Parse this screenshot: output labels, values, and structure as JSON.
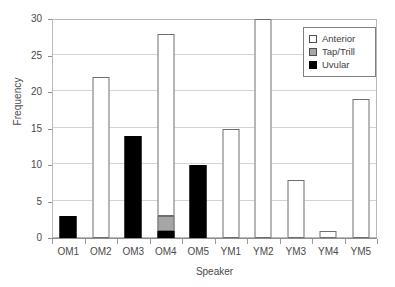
{
  "chart_data": {
    "type": "bar",
    "title": "",
    "xlabel": "Speaker",
    "ylabel": "Frequency",
    "categories": [
      "OM1",
      "OM2",
      "OM3",
      "OM4",
      "OM5",
      "YM1",
      "YM2",
      "YM3",
      "YM4",
      "YM5"
    ],
    "ylim": [
      0,
      30
    ],
    "yticks": [
      0,
      5,
      10,
      15,
      20,
      25,
      30
    ],
    "grid": true,
    "stacked": true,
    "legend_position": "top-right",
    "series": [
      {
        "name": "Anterior",
        "color": "#ffffff",
        "values": [
          0,
          22,
          0,
          25,
          0,
          15,
          30,
          8,
          1,
          19
        ]
      },
      {
        "name": "Tap/Trill",
        "color": "#a6a6a6",
        "values": [
          0,
          0,
          0,
          2,
          0,
          0,
          0,
          0,
          0,
          0
        ]
      },
      {
        "name": "Uvular",
        "color": "#000000",
        "values": [
          3,
          0,
          14,
          1,
          10,
          0,
          0,
          0,
          0,
          0
        ]
      }
    ],
    "bar_totals": [
      3,
      22,
      14,
      28,
      10,
      15,
      30,
      8,
      1,
      19
    ]
  },
  "axes": {
    "y_tick_labels": [
      "0",
      "5",
      "10",
      "15",
      "20",
      "25",
      "30"
    ],
    "x_tick_labels": [
      "OM1",
      "OM2",
      "OM3",
      "OM4",
      "OM5",
      "YM1",
      "YM2",
      "YM3",
      "YM4",
      "YM5"
    ],
    "y_title": "Frequency",
    "x_title": "Speaker"
  },
  "legend": {
    "items": [
      {
        "label": "Anterior",
        "swatch": "white-square-icon"
      },
      {
        "label": "Tap/Trill",
        "swatch": "gray-square-icon"
      },
      {
        "label": "Uvular",
        "swatch": "black-square-icon"
      }
    ]
  }
}
